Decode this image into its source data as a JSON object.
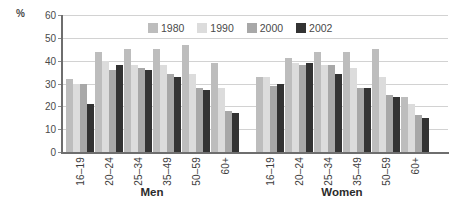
{
  "chart_data": {
    "type": "bar",
    "title": "",
    "xlabel": "",
    "ylabel": "%",
    "ylim": [
      0,
      60
    ],
    "yticks": [
      0,
      10,
      20,
      30,
      40,
      50,
      60
    ],
    "grid": true,
    "legend_position": "top-center",
    "groups": [
      "Men",
      "Women"
    ],
    "categories": [
      "16–19",
      "20–24",
      "25–34",
      "35–49",
      "50–59",
      "60+"
    ],
    "series": [
      {
        "name": "1980",
        "color": "#bdbdbd",
        "values_men": [
          32,
          44,
          45,
          45,
          47,
          39
        ],
        "values_women": [
          33,
          41,
          44,
          44,
          45,
          24
        ]
      },
      {
        "name": "1990",
        "color": "#dcdcdc",
        "values_men": [
          30,
          40,
          38,
          38,
          34,
          28
        ],
        "values_women": [
          33,
          39,
          38,
          37,
          33,
          21
        ]
      },
      {
        "name": "2000",
        "color": "#a8a8a8",
        "values_men": [
          30,
          36,
          37,
          34,
          28,
          18
        ],
        "values_women": [
          29,
          38,
          38,
          28,
          25,
          16
        ]
      },
      {
        "name": "2002",
        "color": "#333333",
        "values_men": [
          21,
          38,
          36,
          33,
          27,
          17
        ],
        "values_women": [
          30,
          39,
          34,
          28,
          24,
          15
        ]
      }
    ]
  },
  "axis": {
    "percent_symbol": "%",
    "tick_labels": [
      "60",
      "50",
      "40",
      "30",
      "20",
      "10",
      "0"
    ]
  },
  "legend": {
    "items": [
      {
        "label": "1980",
        "color": "#bdbdbd"
      },
      {
        "label": "1990",
        "color": "#dcdcdc"
      },
      {
        "label": "2000",
        "color": "#a8a8a8"
      },
      {
        "label": "2002",
        "color": "#333333"
      }
    ]
  },
  "xaxis": {
    "men_labels": [
      "16–19",
      "20–24",
      "25–34",
      "35–49",
      "50–59",
      "60+"
    ],
    "women_labels": [
      "16–19",
      "20–24",
      "25–34",
      "35–49",
      "50–59",
      "60+"
    ],
    "group_men": "Men",
    "group_women": "Women"
  }
}
